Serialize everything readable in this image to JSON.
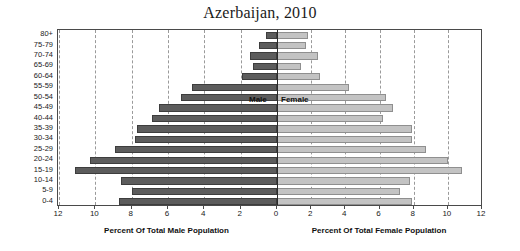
{
  "chart_data": {
    "type": "bar",
    "title": "Azerbaijan, 2010",
    "subtype": "population-pyramid",
    "ylabel": "Age Group",
    "xlabel_left": "Percent Of Total Male Population",
    "xlabel_right": "Percent Of Total Female Population",
    "categories": [
      "80+",
      "75-79",
      "70-74",
      "65-69",
      "60-64",
      "55-59",
      "50-54",
      "45-49",
      "40-44",
      "35-39",
      "30-34",
      "25-29",
      "20-24",
      "15-19",
      "10-14",
      "5-9",
      "0-4"
    ],
    "series": [
      {
        "name": "Male",
        "color": "#5c5c5c",
        "side": "left",
        "values": [
          0.6,
          1.0,
          1.5,
          1.3,
          1.9,
          4.7,
          5.3,
          6.5,
          6.9,
          7.7,
          7.8,
          8.9,
          10.3,
          11.1,
          8.6,
          8.0,
          8.7
        ]
      },
      {
        "name": "Female",
        "color": "#c3c3c3",
        "side": "right",
        "values": [
          1.8,
          1.7,
          2.4,
          1.4,
          2.5,
          4.2,
          6.4,
          6.8,
          6.2,
          7.9,
          7.9,
          8.7,
          10.0,
          10.8,
          7.8,
          7.2,
          7.9
        ]
      }
    ],
    "left_ticks": [
      12,
      10,
      8,
      6,
      4,
      2,
      0
    ],
    "right_ticks": [
      0,
      2,
      4,
      6,
      8,
      10,
      12
    ],
    "xlim_left": [
      12,
      0
    ],
    "xlim_right": [
      0,
      12
    ],
    "grid": true,
    "legend_position": "inside-center",
    "legend_entries": [
      "Male",
      "Female"
    ]
  }
}
